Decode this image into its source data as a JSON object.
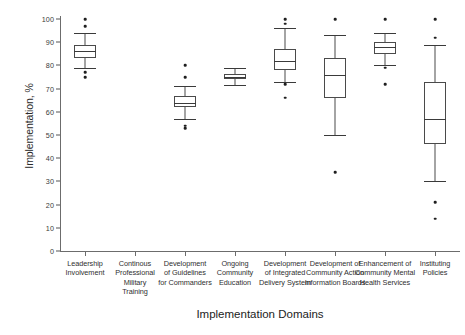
{
  "chart_data": {
    "type": "boxplot",
    "title": "",
    "xlabel": "Implementation Domains",
    "ylabel": "Implementation, %",
    "ylim": [
      0,
      100
    ],
    "ytick_labels": [
      "0",
      "10",
      "20",
      "30",
      "40",
      "50",
      "60",
      "70",
      "80",
      "90",
      "100"
    ],
    "ytick_values": [
      0,
      10,
      20,
      30,
      40,
      50,
      60,
      70,
      80,
      90,
      100
    ],
    "grid": false,
    "legend": null,
    "categories": [
      "Leadership Involvement",
      "Continous Professional Military Training",
      "Development of Guidelines for Commanders",
      "Ongoing Community Education",
      "Development of Integrated Delivery System",
      "Development of Community Action Information Boards",
      "Enhancement of Community Mental Health Services",
      "Instituting Policies"
    ],
    "category_lines": [
      [
        "Leadership",
        "Involvement"
      ],
      [
        "Continous",
        "Professional",
        "Military",
        "Training"
      ],
      [
        "Development",
        "of Guidelines",
        "for Commanders"
      ],
      [
        "Ongoing",
        "Community",
        "Education"
      ],
      [
        "Development",
        "of Integrated",
        "Delivery System"
      ],
      [
        "Development of",
        "Community Action",
        "Information Boards"
      ],
      [
        "Enhancement of",
        "Community Mental",
        "Health Services"
      ],
      [
        "Instituting",
        "Policies"
      ]
    ],
    "boxes": [
      {
        "category": "Leadership Involvement",
        "whisker_low": 79,
        "q1": 83,
        "median": 86,
        "q3": 89,
        "whisker_high": 94,
        "outliers": [
          100,
          97,
          77,
          75
        ]
      },
      {
        "category": "Continous Professional Military Training",
        "whisker_low": null,
        "q1": null,
        "median": null,
        "q3": null,
        "whisker_high": null,
        "outliers": []
      },
      {
        "category": "Development of Guidelines for Commanders",
        "whisker_low": 57,
        "q1": 62,
        "median": 64,
        "q3": 67,
        "whisker_high": 71,
        "outliers": [
          80,
          75,
          54,
          53
        ]
      },
      {
        "category": "Ongoing Community Education",
        "whisker_low": 71.5,
        "q1": 74,
        "median": 75,
        "q3": 76.5,
        "whisker_high": 79,
        "outliers": []
      },
      {
        "category": "Development of Integrated Delivery System",
        "whisker_low": 73,
        "q1": 78,
        "median": 82,
        "q3": 87,
        "whisker_high": 96,
        "outliers": [
          100,
          98,
          72,
          66
        ]
      },
      {
        "category": "Development of Community Action Information Boards",
        "whisker_low": 50,
        "q1": 66,
        "median": 76,
        "q3": 83,
        "whisker_high": 93,
        "outliers": [
          100,
          34
        ]
      },
      {
        "category": "Enhancement of Community Mental Health Services",
        "whisker_low": 80,
        "q1": 85,
        "median": 88,
        "q3": 90,
        "whisker_high": 94,
        "outliers": [
          100,
          79,
          72
        ]
      },
      {
        "category": "Instituting Policies",
        "whisker_low": 30,
        "q1": 46,
        "median": 57,
        "q3": 73,
        "whisker_high": 89,
        "outliers": [
          100,
          92,
          21,
          14
        ]
      }
    ],
    "colors": {
      "box_stroke": "#4a4a4a",
      "median_stroke": "#3a3a3a",
      "outlier_fill": "#1f1f1f",
      "axis": "#6c6c6c",
      "background": "#ffffff",
      "text": "#2a2a2a"
    }
  }
}
